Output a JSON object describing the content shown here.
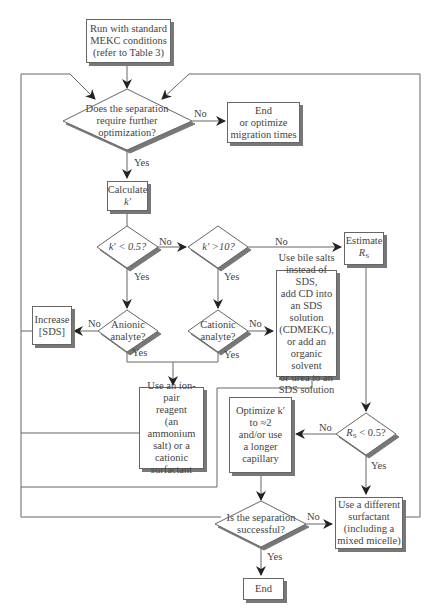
{
  "diagram": {
    "type": "flowchart",
    "colors": {
      "line": "#666666",
      "shadow": "#777777",
      "text": "#444444",
      "background": "#ffffff"
    },
    "nodes": {
      "start": {
        "lines": [
          "Run with standard",
          "MEKC conditions",
          "(refer to Table 3)"
        ]
      },
      "q_optimize": {
        "lines": [
          "Does the separation",
          "require further",
          "optimization?"
        ]
      },
      "end_optimize": {
        "lines": [
          "End",
          "or optimize",
          "migration times"
        ]
      },
      "calc_k": {
        "lines": [
          "Calculate",
          "k′"
        ]
      },
      "q_k_low": {
        "text": "k′ < 0.5?"
      },
      "q_k_high": {
        "text": "k′ >10?"
      },
      "estimate_rs": {
        "line1": "Estimate",
        "line2": "R",
        "line2_sub": "S"
      },
      "q_anionic": {
        "lines": [
          "Anionic",
          "analyte?"
        ]
      },
      "q_cationic": {
        "lines": [
          "Cationic",
          "analyte?"
        ]
      },
      "increase_sds": {
        "lines": [
          "Increase",
          "[SDS]"
        ]
      },
      "bile_salts": {
        "lines": [
          "Use bile salts",
          "instead of SDS,",
          "add CD into",
          "an SDS solution",
          "(CDMEKC),",
          "or add an",
          "organic solvent",
          "or urea to an",
          "SDS solution"
        ]
      },
      "ion_pair": {
        "lines": [
          "Use an ion-pair",
          "reagent",
          "(an ammonium",
          "salt) or a",
          "cationic",
          "surfactant"
        ]
      },
      "optimize_k": {
        "lines": [
          "Optimize k′",
          "to ≈2",
          "and/or use",
          "a longer",
          "capillary"
        ]
      },
      "q_rs": {
        "prefix": "R",
        "sub": "S",
        "suffix": " < 0.5?"
      },
      "different_surfactant": {
        "lines": [
          "Use a different",
          "surfactant",
          "(including a",
          "mixed micelle)"
        ]
      },
      "q_success": {
        "lines": [
          "Is the separation",
          "successful?"
        ]
      },
      "end": {
        "lines": [
          "End"
        ]
      }
    },
    "edge_labels": {
      "q_optimize_no": "No",
      "q_optimize_yes": "Yes",
      "q_k_low_no": "No",
      "q_k_low_yes": "Yes",
      "q_k_high_no": "No",
      "q_k_high_yes": "Yes",
      "q_anionic_no": "No",
      "q_anionic_yes": "Yes",
      "q_cationic_no": "No",
      "q_cationic_yes": "Yes",
      "q_rs_no": "No",
      "q_rs_yes": "Yes",
      "q_success_no": "No",
      "q_success_yes": "Yes"
    }
  }
}
